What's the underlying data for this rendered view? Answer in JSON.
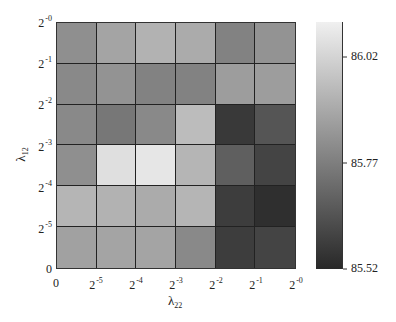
{
  "chart_data": {
    "type": "heatmap",
    "title": "",
    "xlabel": "λ22",
    "ylabel": "λ12",
    "x_ticks": [
      "0",
      "2^-5",
      "2^-4",
      "2^-3",
      "2^-2",
      "2^-1",
      "2^-0"
    ],
    "y_ticks": [
      "0",
      "2^-5",
      "2^-4",
      "2^-3",
      "2^-2",
      "2^-1",
      "2^-0"
    ],
    "x_bins": [
      "0–2^-5",
      "2^-5–2^-4",
      "2^-4–2^-3",
      "2^-3–2^-2",
      "2^-2–2^-1",
      "2^-1–2^-0"
    ],
    "y_bins_top_to_bottom": [
      "2^-1–2^-0",
      "2^-2–2^-1",
      "2^-3–2^-2",
      "2^-4–2^-3",
      "2^-5–2^-4",
      "0–2^-5"
    ],
    "values_top_to_bottom": [
      [
        85.82,
        85.88,
        85.92,
        85.9,
        85.78,
        85.83
      ],
      [
        85.8,
        85.83,
        85.78,
        85.78,
        85.86,
        85.86
      ],
      [
        85.8,
        85.75,
        85.8,
        85.95,
        85.57,
        85.65
      ],
      [
        85.82,
        86.05,
        86.07,
        85.93,
        85.68,
        85.6
      ],
      [
        85.93,
        85.92,
        85.9,
        85.93,
        85.58,
        85.54
      ],
      [
        85.87,
        85.88,
        85.88,
        85.8,
        85.58,
        85.6
      ]
    ],
    "colorbar": {
      "min": 85.52,
      "max": 86.1,
      "ticks": [
        "86.02",
        "85.77",
        "85.52"
      ],
      "colormap": "gray"
    },
    "grid": true,
    "legend": "colorbar right"
  },
  "ylabel_main": "λ",
  "ylabel_sub": "12",
  "xlabel_main": "λ",
  "xlabel_sub": "22"
}
